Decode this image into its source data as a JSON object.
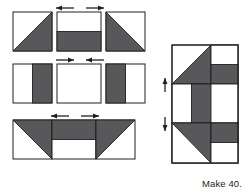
{
  "diagram": {
    "kind": "quilt-block-assembly-diagram",
    "caption": "Make 40.",
    "colors": {
      "background": "#ffffff",
      "fabric_dark": "#58585a",
      "fabric_light": "#ffffff",
      "outline": "#231f20",
      "arrow": "#231f20",
      "text": "#231f20"
    },
    "exploded_view": {
      "label": "unit rows",
      "rows": [
        {
          "label": "row-1",
          "units": [
            {
              "name": "half-square-triangle-dark-lower-right",
              "shading": "diagonal",
              "dark_corner": "lower-right"
            },
            {
              "name": "half-rectangle-dark-bottom",
              "shading": "horizontal-split",
              "dark_side": "bottom"
            },
            {
              "name": "half-square-triangle-dark-lower-left",
              "shading": "diagonal",
              "dark_corner": "lower-left"
            }
          ],
          "press_arrows": [
            {
              "name": "press-arrow-left",
              "direction": "left"
            },
            {
              "name": "press-arrow-right",
              "direction": "right"
            }
          ]
        },
        {
          "label": "row-2",
          "units": [
            {
              "name": "split-rectangle-dark-right",
              "shading": "vertical-split",
              "dark_side": "right"
            },
            {
              "name": "plain-light-square",
              "shading": "solid",
              "dark_side": "none"
            },
            {
              "name": "split-rectangle-dark-left",
              "shading": "vertical-split",
              "dark_side": "left"
            }
          ],
          "press_arrows": [
            {
              "name": "press-arrow-right",
              "direction": "right"
            },
            {
              "name": "press-arrow-left",
              "direction": "left"
            }
          ]
        },
        {
          "label": "row-3",
          "units": [
            {
              "name": "half-square-triangle-dark-upper-left",
              "shading": "diagonal",
              "dark_corner": "upper-left"
            },
            {
              "name": "half-rectangle-dark-top",
              "shading": "horizontal-split",
              "dark_side": "top"
            },
            {
              "name": "half-square-triangle-dark-upper-right",
              "shading": "diagonal",
              "dark_corner": "upper-right"
            }
          ],
          "press_arrows": [
            {
              "name": "press-arrow-left",
              "direction": "left"
            },
            {
              "name": "press-arrow-right",
              "direction": "right"
            }
          ]
        }
      ]
    },
    "assembled_block": {
      "label": "finished-block",
      "grid": "3x3",
      "press_arrows": [
        {
          "name": "row-seam-arrow-upper",
          "direction": "up-down"
        },
        {
          "name": "row-seam-arrow-lower",
          "direction": "up-down"
        }
      ]
    }
  }
}
